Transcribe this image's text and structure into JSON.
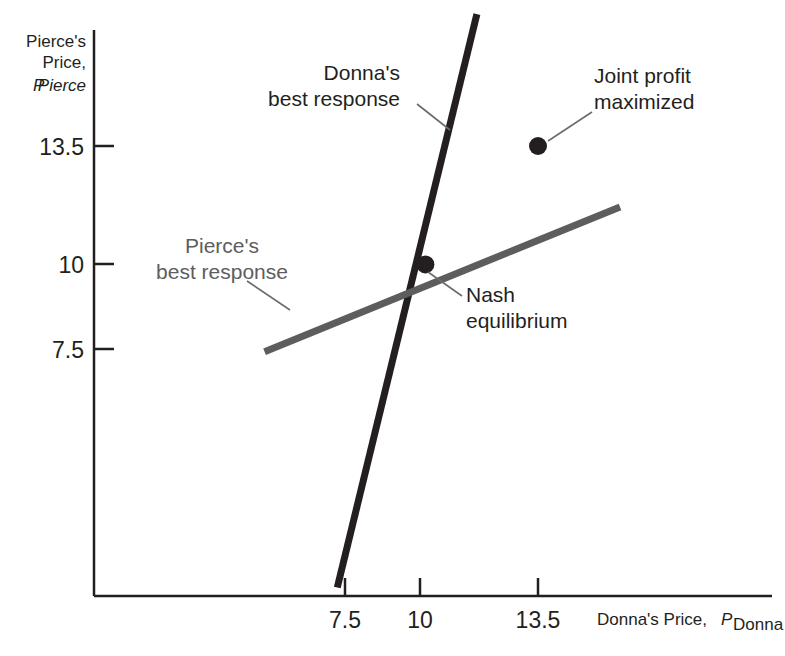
{
  "figure": {
    "background": "#ffffff",
    "width": 785,
    "height": 656
  },
  "axes": {
    "y_title_line1": "Pierce's",
    "y_title_line2": "Price,",
    "y_title_symbol": "P",
    "y_title_subscript": "Pierce",
    "x_title_text": "Donna's Price,",
    "x_title_symbol": "P",
    "x_title_subscript": "Donna",
    "x_ticks": [
      "7.5",
      "10",
      "13.5"
    ],
    "y_ticks": [
      "13.5",
      "10",
      "7.5"
    ],
    "axis_color": "#231f20"
  },
  "annotations": {
    "donna_line1": "Donna's",
    "donna_line2": "best response",
    "pierce_line1": "Pierce's",
    "pierce_line2": "best response",
    "nash_line1": "Nash",
    "nash_line2": "equilibrium",
    "joint_line1": "Joint profit",
    "joint_line2": "maximized"
  },
  "chart_data": {
    "type": "line",
    "title": "",
    "xlabel": "Donna's Price, P_Donna",
    "ylabel": "Pierce's Price, P_Pierce",
    "xlim": [
      5.0,
      18.0
    ],
    "ylim": [
      0.0,
      19.0
    ],
    "grid": false,
    "legend": "none",
    "x_tick_values": [
      7.5,
      10,
      13.5
    ],
    "y_tick_values": [
      13.5,
      10,
      7.5
    ],
    "series": [
      {
        "name": "Donna's best response",
        "color": "#231f20",
        "width": 7,
        "x": [
          7.26,
          11.6
        ],
        "y": [
          0.45,
          17.4
        ]
      },
      {
        "name": "Pierce's best response",
        "color": "#5d5d5d",
        "width": 7,
        "x": [
          5.0,
          16.05
        ],
        "y": [
          7.42,
          11.7
        ]
      }
    ],
    "points": [
      {
        "name": "Nash equilibrium",
        "x": 10,
        "y": 10,
        "color": "#231f20",
        "radius": 9
      },
      {
        "name": "Joint profit maximized",
        "x": 13.5,
        "y": 13.5,
        "color": "#231f20",
        "radius": 9
      }
    ]
  }
}
